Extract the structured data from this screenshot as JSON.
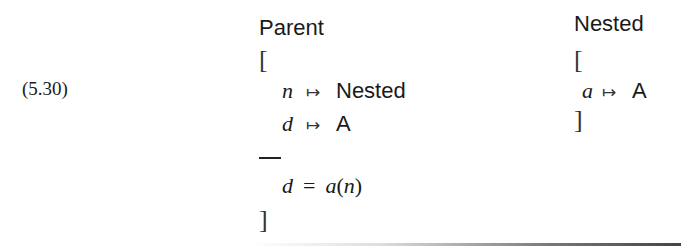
{
  "equation_number": "(5.30)",
  "parent": {
    "title": "Parent",
    "open_bracket": "[",
    "fields": [
      {
        "var": "n",
        "arrow": "↦",
        "type": "Nested"
      },
      {
        "var": "d",
        "arrow": "↦",
        "type": "A"
      }
    ],
    "separator": "—",
    "constraint": {
      "lhs": "d",
      "op": "=",
      "fn": "a",
      "lparen": "(",
      "arg": "n",
      "rparen": ")"
    },
    "close_bracket": "]"
  },
  "nested": {
    "title": "Nested",
    "open_bracket": "[",
    "fields": [
      {
        "var": "a",
        "arrow": "↦",
        "type": "A"
      }
    ],
    "close_bracket": "]"
  }
}
